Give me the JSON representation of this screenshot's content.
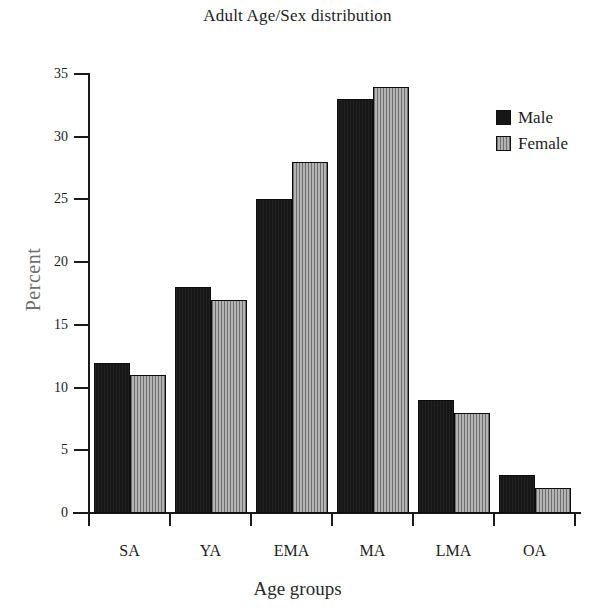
{
  "chart_data": {
    "type": "bar",
    "title": "Adult Age/Sex distribution",
    "xlabel": "Age groups",
    "ylabel": "Percent",
    "categories": [
      "SA",
      "YA",
      "EMA",
      "MA",
      "LMA",
      "OA"
    ],
    "series": [
      {
        "name": "Male",
        "color": "#171717",
        "values": [
          12,
          18,
          25,
          33,
          9,
          3
        ]
      },
      {
        "name": "Female",
        "color": "#9a9a9a",
        "values": [
          11,
          17,
          28,
          34,
          8,
          2
        ]
      }
    ],
    "ylim": [
      0,
      35
    ],
    "ytick_values": [
      0,
      5,
      10,
      15,
      20,
      25,
      30,
      35
    ],
    "ytick_labels": [
      "0",
      "5",
      "10",
      "15",
      "20",
      "25",
      "30",
      "35"
    ],
    "grid": false,
    "legend_position": "top-right",
    "legend_entries": [
      "Male",
      "Female"
    ]
  }
}
